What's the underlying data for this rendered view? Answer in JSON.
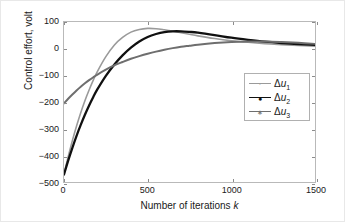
{
  "chart_data": {
    "type": "line",
    "title": "",
    "xlabel": "Number of iterations k",
    "ylabel": "Control effort, volt",
    "xlim": [
      0,
      1500
    ],
    "ylim": [
      -500,
      100
    ],
    "xticks": [
      0,
      500,
      1000,
      1500
    ],
    "xticklabels": [
      "0",
      "500",
      "1000",
      "1500"
    ],
    "yticks": [
      100,
      0,
      -100,
      -200,
      -300,
      -400,
      -500
    ],
    "yticklabels": [
      "100",
      "0",
      "-100",
      "-200",
      "-300",
      "-400",
      "-500"
    ],
    "grid": false,
    "legend_position": "center-right",
    "series": [
      {
        "name": "Δu1",
        "label_delta": "Δ",
        "label_var": "u",
        "label_sub": "1",
        "color": "#9a9a9a",
        "width": 1.6,
        "x": [
          0,
          25,
          50,
          75,
          100,
          125,
          150,
          175,
          200,
          250,
          300,
          350,
          400,
          450,
          500,
          550,
          600,
          650,
          700,
          750,
          800,
          900,
          1000,
          1100,
          1200,
          1300,
          1400,
          1500
        ],
        "y": [
          -470,
          -405,
          -345,
          -290,
          -240,
          -195,
          -155,
          -118,
          -85,
          -30,
          13,
          42,
          62,
          72,
          76,
          75,
          71,
          66,
          60,
          54,
          48,
          38,
          30,
          24,
          19,
          15,
          12,
          9
        ]
      },
      {
        "name": "Δu2",
        "label_delta": "Δ",
        "label_var": "u",
        "label_sub": "2",
        "color": "#101010",
        "width": 2.3,
        "x": [
          0,
          25,
          50,
          75,
          100,
          125,
          150,
          175,
          200,
          250,
          300,
          350,
          400,
          450,
          500,
          550,
          600,
          650,
          700,
          750,
          800,
          900,
          1000,
          1100,
          1200,
          1300,
          1400,
          1500
        ],
        "y": [
          -472,
          -420,
          -372,
          -327,
          -286,
          -248,
          -213,
          -181,
          -152,
          -102,
          -60,
          -25,
          4,
          27,
          44,
          55,
          62,
          65,
          65,
          63,
          60,
          51,
          41,
          33,
          26,
          21,
          17,
          14
        ]
      },
      {
        "name": "Δu3",
        "label_delta": "Δ",
        "label_var": "u",
        "label_sub": "3",
        "color": "#6e6e6e",
        "width": 2.0,
        "x": [
          0,
          25,
          50,
          75,
          100,
          125,
          150,
          175,
          200,
          250,
          300,
          350,
          400,
          450,
          500,
          550,
          600,
          650,
          700,
          750,
          800,
          900,
          1000,
          1100,
          1200,
          1300,
          1400,
          1500
        ],
        "y": [
          -205,
          -188,
          -172,
          -157,
          -143,
          -130,
          -118,
          -107,
          -97,
          -79,
          -63,
          -50,
          -38,
          -28,
          -19,
          -11,
          -4,
          2,
          7,
          11,
          15,
          21,
          25,
          27,
          27,
          25,
          22,
          18
        ]
      }
    ]
  },
  "axes": {
    "xlabel_prefix": "Number of iterations ",
    "xlabel_italic": "k",
    "ylabel_text": "Control effort, volt"
  }
}
